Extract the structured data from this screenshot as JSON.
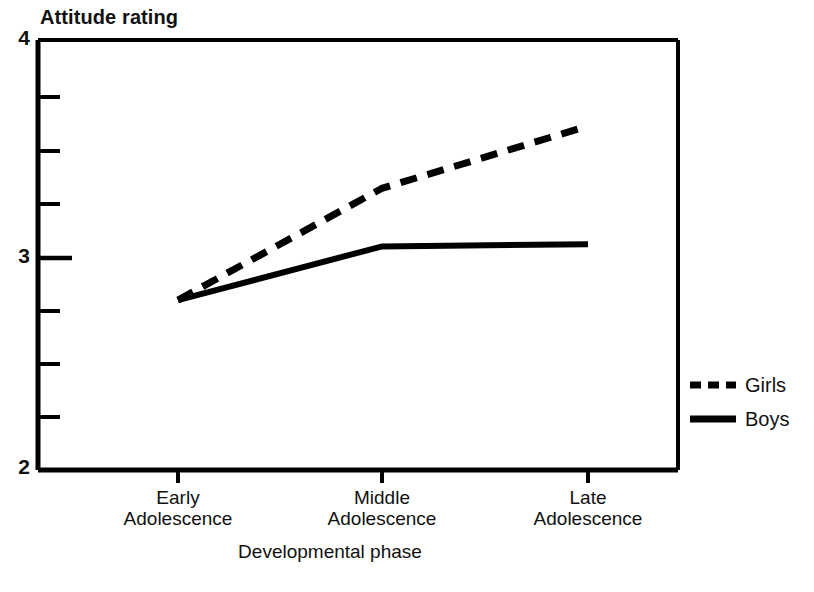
{
  "chart_data": {
    "type": "line",
    "title": "",
    "ylabel": "Attitude rating",
    "xlabel": "Developmental phase",
    "categories": [
      "Early Adolescence",
      "Middle Adolescence",
      "Late Adolescence"
    ],
    "category_lines": [
      [
        "Early",
        "Adolescence"
      ],
      [
        "Middle",
        "Adolescence"
      ],
      [
        "Late",
        "Adolescence"
      ]
    ],
    "series": [
      {
        "name": "Girls",
        "values": [
          2.79,
          3.31,
          3.6
        ],
        "style": "dashed",
        "color": "#000000"
      },
      {
        "name": "Boys",
        "values": [
          2.79,
          3.04,
          3.05
        ],
        "style": "solid",
        "color": "#000000"
      }
    ],
    "ylim": [
      2,
      4
    ],
    "yticks": [
      2,
      3,
      4
    ],
    "ytick_labels": [
      "2",
      "3",
      "4"
    ],
    "yminor_step": 0.25,
    "grid": false,
    "legend_position": "right",
    "legend_entries": [
      "Girls",
      "Boys"
    ]
  },
  "axes": {
    "y_title": "Attitude rating",
    "x_title": "Developmental phase",
    "y_tick_top": "4",
    "y_tick_mid": "3",
    "y_tick_bottom": "2"
  },
  "xticks": {
    "early_line1": "Early",
    "early_line2": "Adolescence",
    "middle_line1": "Middle",
    "middle_line2": "Adolescence",
    "late_line1": "Late",
    "late_line2": "Adolescence"
  },
  "legend": {
    "girls": "Girls",
    "boys": "Boys"
  },
  "colors": {
    "ink": "#000000",
    "background": "#ffffff"
  }
}
